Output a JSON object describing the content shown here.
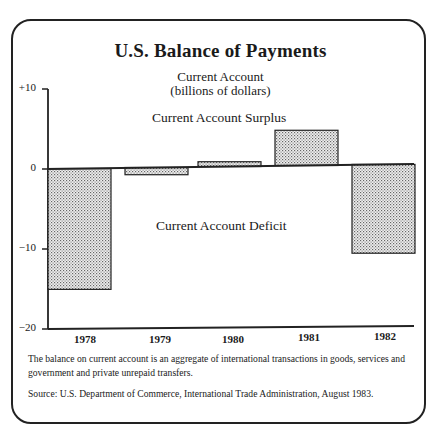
{
  "chart_data": {
    "type": "bar",
    "title": "U.S. Balance of Payments",
    "subtitle": [
      "Current Account",
      "(billions of dollars)"
    ],
    "categories": [
      "1978",
      "1979",
      "1980",
      "1981",
      "1982"
    ],
    "values": [
      -15.1,
      -0.9,
      0.6,
      4.4,
      -11.1
    ],
    "xlabel": "",
    "ylabel": "billions of dollars",
    "ylim": [
      -20,
      10
    ],
    "yticks": [
      10,
      0,
      -10,
      -20
    ],
    "ytick_labels": [
      "+10",
      "0",
      "−10",
      "−20"
    ],
    "annotations": [
      "Current Account Surplus",
      "Current Account Deficit"
    ],
    "grid": false,
    "legend": null
  },
  "header": {
    "faint_text": "———"
  },
  "title": "U.S. Balance of Payments",
  "subtitle_line1": "Current Account",
  "subtitle_line2": "(billions of dollars)",
  "annotations": {
    "surplus": "Current Account Surplus",
    "deficit": "Current Account Deficit"
  },
  "y_axis": {
    "plus10": "+10",
    "zero": "0",
    "minus10": "−10",
    "minus20": "−20"
  },
  "x_axis": {
    "labels": [
      "1978",
      "1979",
      "1980",
      "1981",
      "1982"
    ]
  },
  "notes": {
    "definition": "The balance on current account is an aggregate of international transactions in goods, services and government and private unrepaid transfers.",
    "source": "Source: U.S. Department of Commerce, International Trade Administration, August 1983."
  },
  "colors": {
    "ink": "#222222",
    "bar_fill": "#d9d9d9"
  }
}
